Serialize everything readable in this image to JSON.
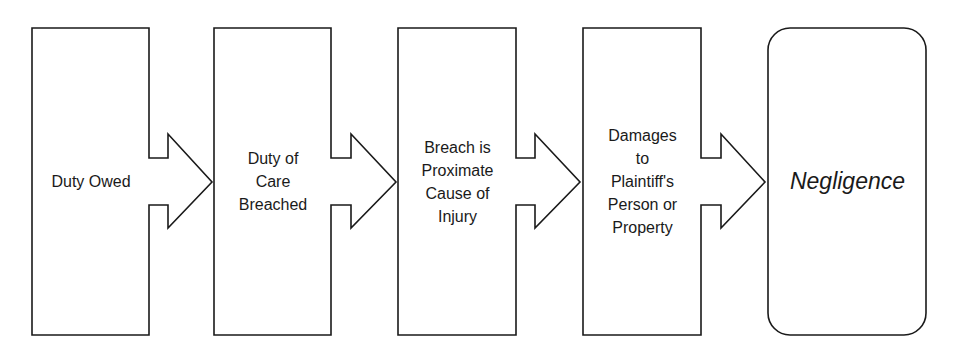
{
  "diagram": {
    "title": "",
    "colors": {
      "stroke": "#1a1a1a",
      "background": "#ffffff",
      "text": "#1a1a1a"
    },
    "steps": [
      {
        "id": "step-1",
        "label": "Duty Owed"
      },
      {
        "id": "step-2",
        "label": "Duty of\nCare\nBreached"
      },
      {
        "id": "step-3",
        "label": "Breach is\nProximate\nCause of\nInjury"
      },
      {
        "id": "step-4",
        "label": "Damages\nto\nPlaintiff's\nPerson or\nProperty"
      }
    ],
    "result": {
      "label": "Negligence"
    },
    "connectors": [
      {
        "from": "step-1",
        "to": "step-2",
        "type": "block-arrow"
      },
      {
        "from": "step-2",
        "to": "step-3",
        "type": "block-arrow"
      },
      {
        "from": "step-3",
        "to": "step-4",
        "type": "block-arrow"
      },
      {
        "from": "step-4",
        "to": "result",
        "type": "block-arrow"
      }
    ]
  }
}
